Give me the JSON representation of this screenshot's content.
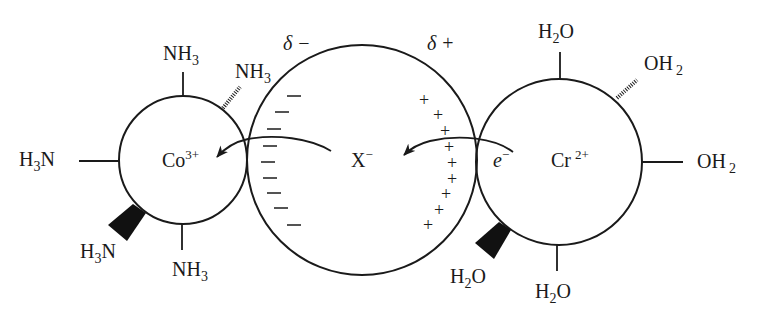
{
  "diagram": {
    "colors": {
      "ink": "#1a1a1a",
      "background": "#ffffff"
    },
    "cobalt_center": {
      "metal": "Co",
      "charge": "3+",
      "circle": {
        "cx": 183,
        "cy": 160,
        "r": 64
      },
      "ligands": {
        "top": {
          "main": "NH",
          "sub": "3",
          "suffix": ""
        },
        "back_right": {
          "main": "NH",
          "sub": "3",
          "suffix": ""
        },
        "left": {
          "prefix": "H",
          "sub": "3",
          "main": "N"
        },
        "front_left": {
          "prefix": "H",
          "sub": "3",
          "main": "N"
        },
        "bottom": {
          "main": "NH",
          "sub": "3",
          "suffix": ""
        }
      }
    },
    "bridge": {
      "ion": "X",
      "charge": "−",
      "circle": {
        "cx": 362,
        "cy": 160,
        "r": 115
      },
      "partial_left": {
        "symbol": "δ",
        "sign": "−"
      },
      "partial_right": {
        "symbol": "δ",
        "sign": "+"
      },
      "minus_signs": [
        {
          "x": 294,
          "y": 96
        },
        {
          "x": 282,
          "y": 112
        },
        {
          "x": 274,
          "y": 129
        },
        {
          "x": 270,
          "y": 146
        },
        {
          "x": 268,
          "y": 162
        },
        {
          "x": 270,
          "y": 178
        },
        {
          "x": 274,
          "y": 193
        },
        {
          "x": 281,
          "y": 208
        },
        {
          "x": 294,
          "y": 225
        }
      ],
      "plus_signs": [
        {
          "x": 424,
          "y": 100
        },
        {
          "x": 438,
          "y": 115
        },
        {
          "x": 445,
          "y": 131
        },
        {
          "x": 449,
          "y": 147
        },
        {
          "x": 452,
          "y": 163
        },
        {
          "x": 452,
          "y": 179
        },
        {
          "x": 446,
          "y": 194
        },
        {
          "x": 439,
          "y": 210
        },
        {
          "x": 428,
          "y": 225
        }
      ],
      "plus_glyph": "+"
    },
    "chromium_center": {
      "metal": "Cr",
      "charge": "2+",
      "electron": {
        "symbol": "e",
        "charge": "−"
      },
      "circle": {
        "cx": 559,
        "cy": 162,
        "r": 83
      },
      "ligands": {
        "top": {
          "prefix": "H",
          "sub": "2",
          "main": "O"
        },
        "back_right": {
          "main": "OH",
          "sub": "2"
        },
        "right": {
          "main": "OH",
          "sub": "2"
        },
        "front_left": {
          "prefix": "H",
          "sub": "2",
          "main": "O"
        },
        "bottom": {
          "prefix": "H",
          "sub": "2",
          "main": "O"
        }
      }
    },
    "arrows": [
      {
        "name": "electron-to-bridge",
        "from": "Cr",
        "to": "X"
      },
      {
        "name": "bridge-to-cobalt",
        "from": "X",
        "to": "Co"
      }
    ]
  }
}
